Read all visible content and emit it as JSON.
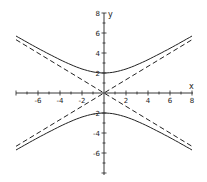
{
  "chart_data": {
    "type": "line",
    "title": "",
    "xlabel": "x",
    "ylabel": "y",
    "xlim": [
      -8,
      8
    ],
    "ylim": [
      -8,
      8
    ],
    "grid": false,
    "x_ticks": [
      -6,
      -4,
      -2,
      2,
      4,
      6,
      8
    ],
    "y_ticks": [
      8,
      6,
      4,
      2,
      -2,
      -4,
      -6
    ],
    "series": [
      {
        "name": "hyperbola upper branch",
        "style": "solid",
        "equation": "y = 2*sqrt(1 + x^2/9)",
        "x": [
          -8,
          -6,
          -4,
          -2,
          0,
          2,
          4,
          6,
          8
        ],
        "values": [
          5.7,
          4.47,
          3.33,
          2.4,
          2.0,
          2.4,
          3.33,
          4.47,
          5.7
        ]
      },
      {
        "name": "hyperbola lower branch",
        "style": "solid",
        "equation": "y = -2*sqrt(1 + x^2/9)",
        "x": [
          -8,
          -6,
          -4,
          -2,
          0,
          2,
          4,
          6,
          8
        ],
        "values": [
          -5.7,
          -4.47,
          -3.33,
          -2.4,
          -2.0,
          -2.4,
          -3.33,
          -4.47,
          -5.7
        ]
      },
      {
        "name": "asymptote y = 2x/3",
        "style": "dashed",
        "x": [
          -8,
          8
        ],
        "values": [
          -5.33,
          5.33
        ]
      },
      {
        "name": "asymptote y = -2x/3",
        "style": "dashed",
        "x": [
          -8,
          8
        ],
        "values": [
          5.33,
          -5.33
        ]
      }
    ]
  },
  "labels": {
    "x_axis": "x",
    "y_axis": "y",
    "x_ticks": [
      "-6",
      "-4",
      "-2",
      "2",
      "4",
      "6",
      "8"
    ],
    "y_ticks": [
      "8",
      "6",
      "4",
      "2",
      "-2",
      "-4",
      "-6"
    ]
  }
}
